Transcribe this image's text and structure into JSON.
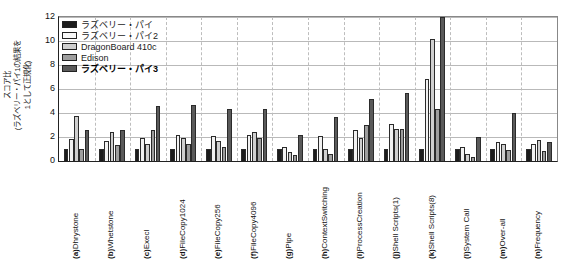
{
  "chart_data": {
    "type": "bar",
    "title": "",
    "xlabel": "",
    "ylabel": "スコア比 (ラズベリー・パイ1の結果を 1として正規化)",
    "ylabel_lines": [
      "スコア比",
      "(ラズベリー・パイ1の結果を",
      "1として正規化)"
    ],
    "ylim": [
      0,
      12
    ],
    "yticks": [
      0,
      2,
      4,
      6,
      8,
      10,
      12
    ],
    "grid": "horizontal-solid-and-vertical-dashed-group-separators",
    "legend_position": "top-left-inside",
    "categories": [
      "(a) Dhrystone",
      "(b) Whetstone",
      "(c) Execl",
      "(d) FileCopy1024",
      "(e) FileCopy256",
      "(f) FileCopy4096",
      "(g) Pipe",
      "(h) ContextSwitching",
      "(i) ProcessCreation",
      "(j) Shell Scripts(1)",
      "(k) Shell Scripts(8)",
      "(l) System Call",
      "(m) Over-all",
      "(n) Frequency"
    ],
    "category_prefixes": [
      "(a)",
      "(b)",
      "(c)",
      "(d)",
      "(e)",
      "(f)",
      "(g)",
      "(h)",
      "(i)",
      "(j)",
      "(k)",
      "(l)",
      "(m)",
      "(n)"
    ],
    "category_names": [
      "Dhrystone",
      "Whetstone",
      "Execl",
      "FileCopy1024",
      "FileCopy256",
      "FileCopy4096",
      "Pipe",
      "ContextSwitching",
      "ProcessCreation",
      "Shell Scripts(1)",
      "Shell Scripts(8)",
      "System Call",
      "Over-all",
      "Frequency"
    ],
    "series": [
      {
        "name": "ラズベリー・パイ",
        "color": "#1c1c1c",
        "values": [
          1.0,
          1.0,
          1.0,
          1.0,
          1.0,
          1.0,
          1.0,
          1.0,
          1.0,
          1.0,
          1.0,
          1.0,
          1.0,
          1.0
        ]
      },
      {
        "name": "ラズベリー・パイ2",
        "color": "#f2f2f2",
        "values": [
          1.85,
          1.7,
          1.9,
          2.15,
          2.05,
          2.2,
          1.15,
          2.05,
          2.6,
          3.05,
          6.8,
          1.15,
          1.55,
          1.45
        ]
      },
      {
        "name": "DragonBoard 410c",
        "color": "#cfcfcf",
        "values": [
          3.75,
          2.45,
          1.4,
          1.95,
          1.7,
          2.4,
          0.75,
          1.0,
          1.95,
          2.65,
          10.2,
          0.6,
          1.45,
          1.75
        ]
      },
      {
        "name": "Edison",
        "color": "#9e9e9e",
        "values": [
          1.0,
          1.3,
          2.6,
          1.4,
          1.2,
          1.95,
          0.5,
          0.6,
          3.0,
          2.65,
          4.35,
          0.35,
          0.95,
          0.8
        ]
      },
      {
        "name": "ラズベリー・パイ3",
        "color": "#5a5a5a",
        "values": [
          2.6,
          2.55,
          4.55,
          4.65,
          4.3,
          4.3,
          2.2,
          3.65,
          5.2,
          5.7,
          12.6,
          2.0,
          4.0,
          1.55
        ]
      }
    ],
    "clipped_note": "Shell Scripts(8) ラズベリー・パイ3 bar extends beyond the 12 axis maximum"
  },
  "legend": {
    "items": [
      {
        "label": "ラズベリー・パイ",
        "color": "#1c1c1c",
        "bold": false
      },
      {
        "label": "ラズベリー・パイ2",
        "color": "#f8f8f8",
        "bold": false
      },
      {
        "label": "DragonBoard 410c",
        "color": "#cfcfcf",
        "bold": false
      },
      {
        "label": "Edison",
        "color": "#9e9e9e",
        "bold": false
      },
      {
        "label": "ラズベリー・パイ3",
        "color": "#5a5a5a",
        "bold": true
      }
    ]
  }
}
